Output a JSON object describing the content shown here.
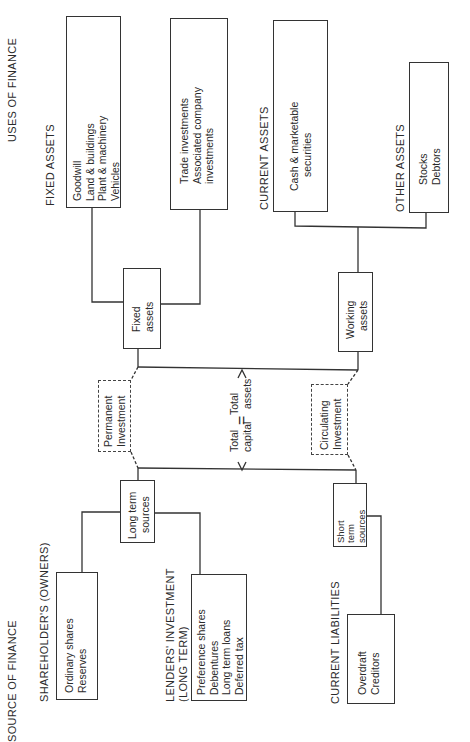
{
  "title_uses": "USES OF FINANCE",
  "title_sources": "SOURCE OF FINANCE",
  "uses": {
    "fixed_assets": {
      "heading": "FIXED ASSETS",
      "box1": [
        "Goodwill",
        "Land & buildings",
        "Plant & machinery",
        "Vehicles"
      ],
      "box2": [
        "Trade investments",
        "Associated company",
        "investments"
      ]
    },
    "current_assets": {
      "heading": "CURRENT ASSETS",
      "box": [
        "Cash & marketable",
        "securities"
      ]
    },
    "other_assets": {
      "heading": "OTHER ASSETS",
      "box": [
        "Stocks",
        "Debtors"
      ]
    }
  },
  "middle": {
    "fixed_assets_box": [
      "Fixed",
      "assets"
    ],
    "working_assets_box": [
      "Working",
      "assets"
    ],
    "permanent_investment": [
      "Permanent",
      "Investment"
    ],
    "circulating_investment": [
      "Circulating",
      "Investment"
    ],
    "equation": {
      "left": [
        "Total",
        "capital"
      ],
      "equals": "=",
      "right": [
        "Total",
        "assets"
      ]
    },
    "long_term_sources": [
      "Long term",
      "sources"
    ],
    "short_term_sources": [
      "Short",
      "term",
      "sources"
    ]
  },
  "sources": {
    "shareholders": {
      "heading": "SHAREHOLDER'S (OWNERS)",
      "box": [
        "Ordinary shares",
        "Reserves"
      ]
    },
    "lenders": {
      "heading": [
        "LENDERS' INVESTMENT",
        "(LONG TERM)"
      ],
      "box": [
        "Preference shares",
        "Debentures",
        "Long term loans",
        "Deferred tax"
      ]
    },
    "current_liabilities": {
      "heading": "CURRENT LIABILITIES",
      "box": [
        "Overdraft",
        "Creditors"
      ]
    }
  }
}
